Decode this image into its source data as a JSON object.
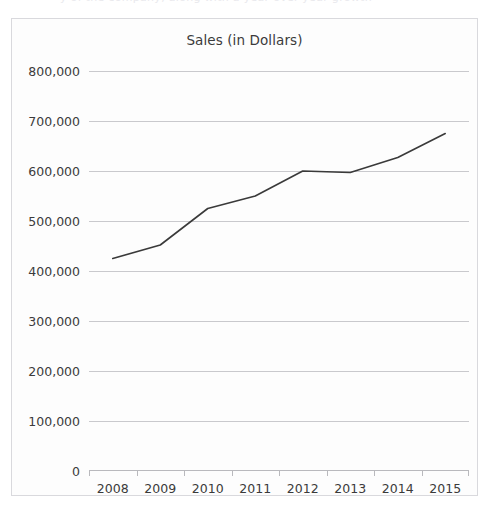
{
  "page": {
    "top_cut_text": "y of the company, along with a year-over-year growth"
  },
  "chart": {
    "title": "Sales (in Dollars)"
  },
  "chart_data": {
    "type": "line",
    "title": "Sales (in Dollars)",
    "xlabel": "",
    "ylabel": "",
    "categories": [
      "2008",
      "2009",
      "2010",
      "2011",
      "2012",
      "2013",
      "2014",
      "2015"
    ],
    "values": [
      425000,
      452000,
      525000,
      550000,
      600000,
      597000,
      627000,
      675000
    ],
    "series": [
      {
        "name": "Sales",
        "values": [
          425000,
          452000,
          525000,
          550000,
          600000,
          597000,
          627000,
          675000
        ],
        "color": "#3a3a3a"
      }
    ],
    "ylim": [
      0,
      800000
    ],
    "ytick_values": [
      0,
      100000,
      200000,
      300000,
      400000,
      500000,
      600000,
      700000,
      800000
    ],
    "ytick_labels": [
      "0",
      "100,000",
      "200,000",
      "300,000",
      "400,000",
      "500,000",
      "600,000",
      "700,000",
      "800,000"
    ],
    "grid": true,
    "grid_color": "#c9c9cd",
    "legend": false,
    "legend_position": "none",
    "markers": false,
    "line_color": "#3a3a3a",
    "background_color": "#fdfdfd",
    "border_color": "#d9d9dd"
  }
}
